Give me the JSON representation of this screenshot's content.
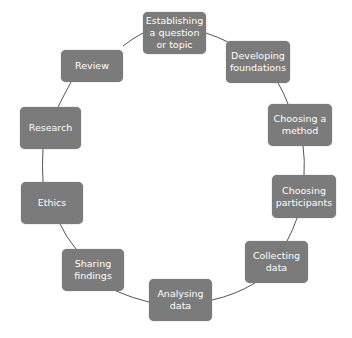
{
  "diagram": {
    "type": "cycle",
    "colors": {
      "node_fill": "#7b7b7b",
      "node_text": "#ffffff",
      "connector": "#555555",
      "background": "#ffffff"
    },
    "nodes": [
      {
        "id": "n1",
        "label": "Establishing a question or topic",
        "x": 143,
        "y": 12,
        "w": 63,
        "h": 42
      },
      {
        "id": "n2",
        "label": "Developing foundations",
        "x": 226,
        "y": 41,
        "w": 64,
        "h": 42
      },
      {
        "id": "n3",
        "label": "Choosing a method",
        "x": 268,
        "y": 104,
        "w": 64,
        "h": 42
      },
      {
        "id": "n4",
        "label": "Choosing participants",
        "x": 272,
        "y": 175,
        "w": 64,
        "h": 43
      },
      {
        "id": "n5",
        "label": "Collecting data",
        "x": 245,
        "y": 241,
        "w": 63,
        "h": 42
      },
      {
        "id": "n6",
        "label": "Analysing data",
        "x": 149,
        "y": 279,
        "w": 63,
        "h": 42
      },
      {
        "id": "n7",
        "label": "Sharing findings",
        "x": 62,
        "y": 249,
        "w": 62,
        "h": 42
      },
      {
        "id": "n8",
        "label": "Ethics",
        "x": 21,
        "y": 182,
        "w": 62,
        "h": 42
      },
      {
        "id": "n9",
        "label": "Research",
        "x": 20,
        "y": 107,
        "w": 61,
        "h": 42
      },
      {
        "id": "n10",
        "label": "Review",
        "x": 61,
        "y": 50,
        "w": 62,
        "h": 32
      }
    ]
  }
}
